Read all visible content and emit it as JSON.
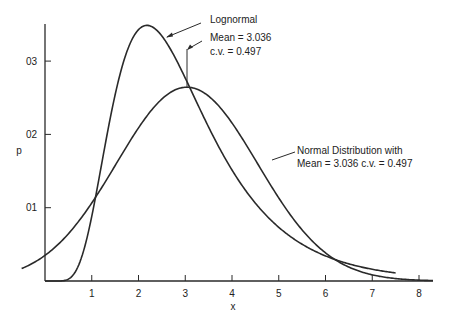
{
  "chart_data": {
    "type": "line",
    "title": "",
    "xlabel": "x",
    "ylabel": "p",
    "xlim": [
      0,
      8.3
    ],
    "ylim": [
      0,
      0.35
    ],
    "grid": false,
    "x_ticks": [
      1,
      2,
      3,
      4,
      5,
      6,
      7,
      8
    ],
    "x_tick_labels": [
      "1",
      "2",
      "3",
      "4",
      "5",
      "6",
      "7",
      "8"
    ],
    "y_ticks": [
      0.1,
      0.2,
      0.3
    ],
    "y_tick_labels": [
      "01",
      "02",
      "03"
    ],
    "series": [
      {
        "name": "Lognormal",
        "distribution": "lognormal",
        "mean": 3.036,
        "cv": 0.497,
        "x": [
          0.0,
          0.25,
          0.5,
          0.75,
          1.0,
          1.25,
          1.5,
          1.75,
          2.0,
          2.18,
          2.5,
          2.75,
          3.0,
          3.25,
          3.5,
          3.75,
          4.0,
          4.5,
          5.0,
          5.5,
          6.0,
          6.5,
          7.0,
          7.5
        ],
        "values": [
          0.0,
          0.0,
          0.005,
          0.04,
          0.117,
          0.208,
          0.285,
          0.333,
          0.352,
          0.354,
          0.338,
          0.313,
          0.281,
          0.247,
          0.214,
          0.183,
          0.155,
          0.108,
          0.074,
          0.05,
          0.034,
          0.023,
          0.015,
          0.01
        ]
      },
      {
        "name": "Normal Distribution with Mean = 3.036 c.v. = 0.497",
        "distribution": "normal",
        "mean": 3.036,
        "cv": 0.497,
        "x": [
          -0.5,
          0.0,
          0.5,
          1.0,
          1.5,
          2.0,
          2.5,
          3.036,
          3.5,
          4.0,
          4.5,
          5.0,
          5.5,
          6.0,
          6.5,
          7.0,
          7.5,
          8.0,
          8.3
        ],
        "values": [
          0.018,
          0.035,
          0.065,
          0.106,
          0.158,
          0.21,
          0.248,
          0.264,
          0.252,
          0.215,
          0.165,
          0.113,
          0.07,
          0.036,
          0.018,
          0.008,
          0.003,
          0.001,
          0.0005
        ]
      }
    ],
    "annotations": [
      {
        "text": "Lognormal",
        "target_series": 0
      },
      {
        "text": "Mean = 3.036",
        "target": "mean line"
      },
      {
        "text": "c.v. = 0.497",
        "target": "mean line"
      },
      {
        "text": "Normal Distribution  with",
        "target_series": 1
      },
      {
        "text": "Mean = 3.036   c.v. = 0.497",
        "target_series": 1
      }
    ]
  },
  "labels": {
    "x_axis": "x",
    "y_axis": "p",
    "lognormal_title": "Lognormal",
    "lognormal_mean": "Mean = 3.036",
    "lognormal_cv": "c.v. = 0.497",
    "normal_line1": "Normal Distribution  with",
    "normal_line2": "Mean = 3.036   c.v. = 0.497"
  },
  "colors": {
    "line": "#2a2a2a",
    "background": "#ffffff"
  }
}
